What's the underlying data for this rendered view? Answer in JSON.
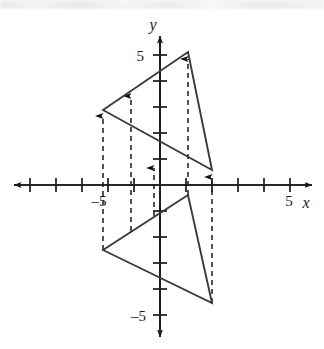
{
  "figure": {
    "title_fragment": "",
    "axes": {
      "x_axis_label": "x",
      "y_axis_label": "y",
      "x_tick_labels": [
        {
          "value": -5,
          "text": "–5"
        },
        {
          "value": 5,
          "text": "5"
        }
      ],
      "y_tick_labels": [
        {
          "value": 5,
          "text": "5"
        },
        {
          "value": -5,
          "text": "–5"
        }
      ],
      "x_range": [
        -6.2,
        6.2
      ],
      "y_range": [
        -6.2,
        5.8
      ],
      "origin_px": [
        160,
        185
      ],
      "unit_px": 26,
      "tick_values_x": [
        -5,
        -4,
        -3,
        -2,
        -1,
        1,
        2,
        3,
        4,
        5
      ],
      "tick_values_y": [
        5,
        4,
        3,
        2,
        1,
        -1,
        -2,
        -3,
        -4,
        -5
      ],
      "grid": false,
      "axis_color": "#1a1a1a"
    },
    "shapes": [
      {
        "name": "preimage-triangle",
        "role": "preimage",
        "vertices": [
          {
            "label": "A",
            "x": -2.2,
            "y": -2.5
          },
          {
            "label": "B",
            "x": 1.08,
            "y": -0.38
          },
          {
            "label": "C",
            "x": 2.0,
            "y": -4.54
          }
        ],
        "stroke": "#3a3a3a",
        "fill": "none"
      },
      {
        "name": "image-triangle",
        "role": "image",
        "vertices": [
          {
            "label": "A'",
            "x": -2.2,
            "y": 2.88
          },
          {
            "label": "B'",
            "x": 1.08,
            "y": 5.11
          },
          {
            "label": "C'",
            "x": 2.0,
            "y": 0.58
          }
        ],
        "stroke": "#3a3a3a",
        "fill": "none"
      }
    ],
    "translation_arrows": [
      {
        "name": "arrow-vertex-a",
        "x": -2.2,
        "y_from": -2.5,
        "y_to": 2.7
      },
      {
        "name": "arrow-midline-left",
        "x": -1.12,
        "y_from": -1.78,
        "y_to": 3.5
      },
      {
        "name": "arrow-short-axis",
        "x": -0.23,
        "y_from": -1.2,
        "y_to": 0.72
      },
      {
        "name": "arrow-vertex-b",
        "x": 1.08,
        "y_from": -0.38,
        "y_to": 4.92
      },
      {
        "name": "arrow-vertex-c",
        "x": 2.0,
        "y_from": -4.54,
        "y_to": 0.4
      }
    ],
    "arrow_style": {
      "dash": "5,4",
      "color": "#1a1a1a",
      "head": "filled-triangle"
    }
  }
}
